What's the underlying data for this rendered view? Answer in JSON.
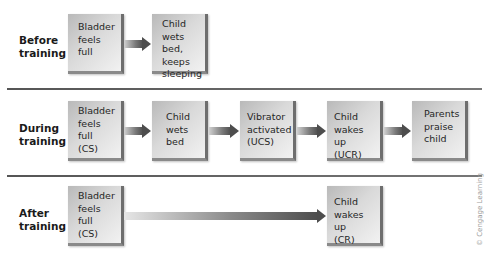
{
  "rows": [
    {
      "label": "Before\ntraining",
      "boxes": [
        {
          "text": "Bladder\nfeels\nfull"
        },
        {
          "text": "Child\nwets bed,\nkeeps\nsleeping"
        }
      ]
    },
    {
      "label": "During\ntraining",
      "boxes": [
        {
          "text": "Bladder\nfeels\nfull\n(CS)"
        },
        {
          "text": "Child\nwets\nbed"
        },
        {
          "text": "Vibrator\nactivated\n(UCS)"
        },
        {
          "text": "Child\nwakes up\n(UCR)"
        },
        {
          "text": "Parents\npraise\nchild"
        }
      ]
    },
    {
      "label": "After\ntraining",
      "boxes": [
        {
          "text": "Bladder\nfeels\nfull\n(CS)"
        },
        {
          "text": "Child\nwakes up\n(CR)"
        }
      ]
    }
  ],
  "credit": "© Cengage Learning",
  "colors": {
    "box_light": "#f2f2f2",
    "box_dark": "#b9b9b9",
    "arrow_dark": "#4d4d4d",
    "separator": "#666666"
  }
}
